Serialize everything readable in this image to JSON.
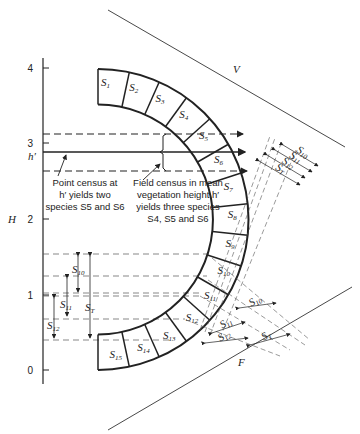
{
  "figure": {
    "axis_label": "H",
    "axis_ticks": [
      "0",
      "1",
      "2",
      "3",
      "4"
    ],
    "h_prime_label": "h′",
    "line_v_label": "V",
    "line_f_label": "F",
    "segments": [
      "S1",
      "S2",
      "S3",
      "S4",
      "S5",
      "S6",
      "S7",
      "S8",
      "S9",
      "S10",
      "S11",
      "S12",
      "S13",
      "S14",
      "S15"
    ],
    "height_ranges_left": [
      "S10",
      "S11",
      "S12",
      "ST"
    ],
    "projections_v": [
      "S10",
      "S11",
      "S12",
      "ST"
    ],
    "projections_f": [
      "S10",
      "S11",
      "S12",
      "ST"
    ],
    "annotation_point": {
      "lines": [
        "Point census at",
        "h′ yields two",
        "species S5 and S6"
      ]
    },
    "annotation_field": {
      "lines": [
        "Field census in mean",
        "vegetation height h′",
        "yields three species",
        "S4, S5 and S6"
      ]
    }
  }
}
